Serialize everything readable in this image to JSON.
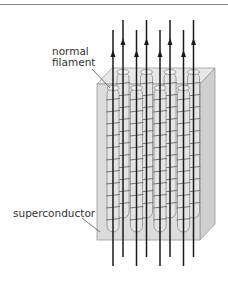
{
  "figure": {
    "labels": {
      "normal_filament_line1": "normal",
      "normal_filament_line2": "filament",
      "superconductor": "superconductor"
    },
    "filament_rows": 2,
    "filaments_per_row": 4,
    "field_line_direction": "up",
    "colors": {
      "block_fill": "#dcdcdc",
      "block_top": "#e8e8e8",
      "block_side": "#cfcfcf",
      "edge": "#9a9a9a",
      "field_line": "#1a1a1a",
      "filament_outline": "#8c8c8c",
      "text": "#333333"
    }
  }
}
